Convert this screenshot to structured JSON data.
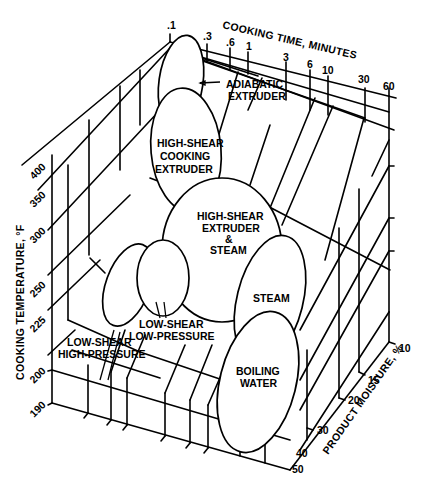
{
  "diagram": {
    "axes": {
      "time": {
        "label": "COOKING TIME, MINUTES",
        "ticks": [
          ".1",
          ".3",
          ".6",
          "1",
          "3",
          "6",
          "10",
          "30",
          "60"
        ]
      },
      "temperature": {
        "label": "COOKING TEMPERATURE, °F",
        "ticks": [
          "190",
          "200",
          "225",
          "250",
          "300",
          "350",
          "400"
        ]
      },
      "moisture": {
        "label": "PRODUCT MOISTURE, %",
        "ticks": [
          "10",
          "15",
          "20",
          "30",
          "40",
          "50"
        ]
      }
    },
    "regions": {
      "adiabatic": {
        "line1": "ADIABATIC",
        "line2": "EXTRUDER"
      },
      "hs_cooking": {
        "line1": "HIGH-SHEAR",
        "line2": "COOKING",
        "line3": "EXTRUDER"
      },
      "hs_steam": {
        "line1": "HIGH-SHEAR",
        "line2": "EXTRUDER",
        "line3": "&",
        "line4": "STEAM"
      },
      "steam": {
        "line1": "STEAM"
      },
      "boiling": {
        "line1": "BOILING",
        "line2": "WATER"
      },
      "ls_lp": {
        "line1": "LOW-SHEAR",
        "line2": "LOW-PRESSURE"
      },
      "ls_hp": {
        "line1": "LOW-SHEAR",
        "line2": "HIGH-PRESSURE"
      }
    }
  }
}
